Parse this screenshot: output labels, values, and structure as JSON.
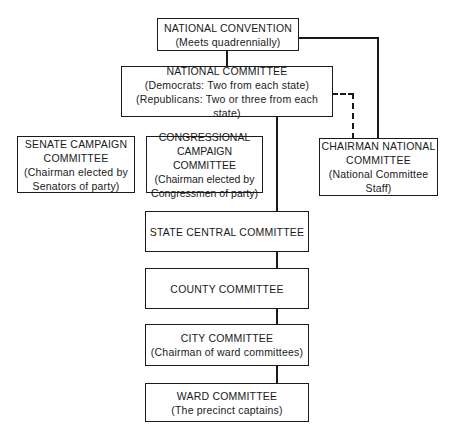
{
  "diagram": {
    "type": "organization-chart",
    "nodes": {
      "national_convention": {
        "title": "NATIONAL CONVENTION",
        "lines": [
          "(Meets quadrennially)"
        ]
      },
      "national_committee": {
        "title": "NATIONAL COMMITTEE",
        "lines": [
          "(Democrats: Two from each state)",
          "(Republicans: Two or three from each state)"
        ]
      },
      "senate_campaign": {
        "title": "SENATE CAMPAIGN",
        "title2": "COMMITTEE",
        "lines": [
          "(Chairman elected by",
          "Senators of party)"
        ]
      },
      "congressional_campaign": {
        "title": "CONGRESSIONAL",
        "title2": "CAMPAIGN COMMITTEE",
        "lines": [
          "(Chairman elected by",
          "Congressmen of party)"
        ]
      },
      "chairman_national": {
        "title": "CHAIRMAN NATIONAL",
        "title2": "COMMITTEE",
        "lines": [
          "(National Committee",
          "Staff)"
        ]
      },
      "state_central": {
        "title": "STATE CENTRAL COMMITTEE"
      },
      "county": {
        "title": "COUNTY COMMITTEE"
      },
      "city": {
        "title": "CITY COMMITTEE",
        "lines": [
          "(Chairman of ward committees)"
        ]
      },
      "ward": {
        "title": "WARD COMMITTEE",
        "lines": [
          "(The precinct captains)"
        ]
      }
    },
    "edges": [
      {
        "from": "national_convention",
        "to": "national_committee",
        "style": "solid"
      },
      {
        "from": "national_convention",
        "to": "chairman_national",
        "style": "solid"
      },
      {
        "from": "national_committee",
        "to": "chairman_national",
        "style": "dashed"
      },
      {
        "from": "national_committee",
        "to": "state_central",
        "style": "solid"
      },
      {
        "from": "state_central",
        "to": "county",
        "style": "solid"
      },
      {
        "from": "county",
        "to": "city",
        "style": "solid"
      },
      {
        "from": "city",
        "to": "ward",
        "style": "solid"
      }
    ]
  }
}
